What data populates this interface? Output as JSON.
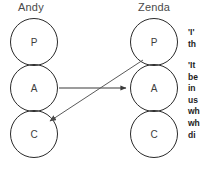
{
  "diagram": {
    "columns": [
      {
        "id": "andy",
        "header": "Andy",
        "states": [
          {
            "id": "andy-p",
            "label": "P",
            "name": "parent"
          },
          {
            "id": "andy-a",
            "label": "A",
            "name": "adult"
          },
          {
            "id": "andy-c",
            "label": "C",
            "name": "child"
          }
        ]
      },
      {
        "id": "zenda",
        "header": "Zenda",
        "states": [
          {
            "id": "zenda-p",
            "label": "P",
            "name": "parent"
          },
          {
            "id": "zenda-a",
            "label": "A",
            "name": "adult"
          },
          {
            "id": "zenda-c",
            "label": "C",
            "name": "child"
          }
        ]
      }
    ],
    "arrows": [
      {
        "id": "stimulus",
        "from": "andy-a",
        "to": "zenda-a",
        "direction": "left-to-right"
      },
      {
        "id": "response",
        "from": "zenda-p",
        "to": "andy-c",
        "direction": "diagonal-down-left"
      }
    ],
    "colors": {
      "circle_stroke": "#2a2a2a",
      "circle_label": "#3d3d3d",
      "header_text": "#4a4a4a",
      "arrow": "#3a3a3a",
      "note_text": "#1d1d1d",
      "background": "#ffffff"
    }
  },
  "notes": [
    {
      "id": "note-one",
      "text": "'I'\nth"
    },
    {
      "id": "note-two",
      "text": "'It\nbe\nin\nus\nwh\nwh\ndi"
    }
  ]
}
